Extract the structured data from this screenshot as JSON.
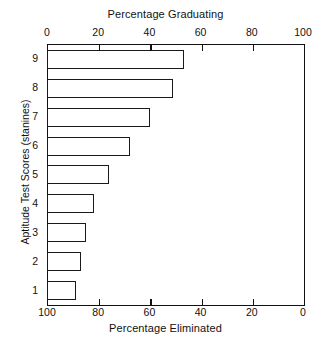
{
  "chart_data": {
    "type": "bar",
    "orientation": "horizontal",
    "title": "",
    "top_axis_title": "Percentage Graduating",
    "bottom_axis_title": "Percentage Eliminated",
    "ylabel": "Aptitude Test Scores (stanines)",
    "xlabel": "Percentage Graduating",
    "categories": [
      "9",
      "8",
      "7",
      "6",
      "5",
      "4",
      "3",
      "2",
      "1"
    ],
    "values": [
      53,
      49,
      40,
      32,
      24,
      18,
      15,
      13,
      11
    ],
    "xlim": [
      0,
      100
    ],
    "grid": false,
    "legend": false,
    "top_ticks": [
      {
        "value": 0,
        "label": "0"
      },
      {
        "value": 20,
        "label": "20"
      },
      {
        "value": 40,
        "label": "40"
      },
      {
        "value": 60,
        "label": "60"
      },
      {
        "value": 80,
        "label": "80"
      },
      {
        "value": 100,
        "label": "100"
      }
    ],
    "bottom_ticks": [
      {
        "value": 0,
        "label": "100"
      },
      {
        "value": 20,
        "label": "80"
      },
      {
        "value": 40,
        "label": "60"
      },
      {
        "value": 60,
        "label": "40"
      },
      {
        "value": 80,
        "label": "20"
      },
      {
        "value": 100,
        "label": "0"
      }
    ],
    "bar_facecolor": "#ffffff",
    "bar_edgecolor": "#1a1a1a",
    "axis_color": "#111111"
  }
}
